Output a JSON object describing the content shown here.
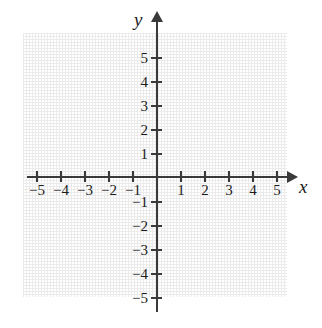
{
  "figure": {
    "type": "coordinate-plane",
    "title": "",
    "background_color": "#ffffff",
    "axis_color": "#3a3a3a",
    "grid_color": "#e6e6e6",
    "label_color": "#1c1c1c"
  },
  "axes": {
    "x": {
      "name": "x",
      "min": -5,
      "max": 5,
      "tick_labels": [
        "-5",
        "-4",
        "-3",
        "-2",
        "-1",
        "1",
        "2",
        "3",
        "4",
        "5"
      ],
      "tick_values": [
        -5,
        -4,
        -3,
        -2,
        -1,
        1,
        2,
        3,
        4,
        5
      ],
      "arrowhead": "right"
    },
    "y": {
      "name": "y",
      "min": -5,
      "max": 5,
      "tick_labels": [
        "5",
        "4",
        "3",
        "2",
        "1",
        "-1",
        "-2",
        "-3",
        "-4",
        "-5"
      ],
      "tick_values": [
        5,
        4,
        3,
        2,
        1,
        -1,
        -2,
        -3,
        -4,
        -5
      ],
      "arrowhead": "up"
    }
  },
  "chart_data": {
    "type": "scatter",
    "title": "",
    "xlabel": "x",
    "ylabel": "y",
    "xlim": [
      -5.5,
      5.5
    ],
    "ylim": [
      -5.5,
      5.5
    ],
    "grid": true,
    "grid_style": "dotted",
    "grid_spacing": 1,
    "legend": null,
    "series": [],
    "x_ticks": [
      -5,
      -4,
      -3,
      -2,
      -1,
      1,
      2,
      3,
      4,
      5
    ],
    "y_ticks": [
      -5,
      -4,
      -3,
      -2,
      -1,
      1,
      2,
      3,
      4,
      5
    ],
    "x_tick_labels": [
      "-5",
      "-4",
      "-3",
      "-2",
      "-1",
      "1",
      "2",
      "3",
      "4",
      "5"
    ],
    "y_tick_labels": [
      "-5",
      "-4",
      "-3",
      "-2",
      "-1",
      "1",
      "2",
      "3",
      "4",
      "5"
    ],
    "annotations": [],
    "note": "Empty blank Cartesian grid with no plotted data points or curves."
  }
}
